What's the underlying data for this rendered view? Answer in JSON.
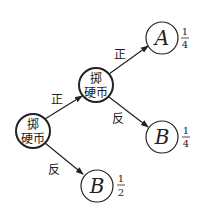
{
  "diagram": {
    "type": "probability-tree",
    "root": {
      "label_line1": "掷",
      "label_line2": "硬币"
    },
    "middle": {
      "label_line1": "掷",
      "label_line2": "硬币"
    },
    "edges": {
      "root_to_middle": "正",
      "root_to_leaf_b2": "反",
      "middle_to_leaf_a": "正",
      "middle_to_leaf_b1": "反"
    },
    "leaves": {
      "a": {
        "label": "A",
        "prob_num": "1",
        "prob_den": "4"
      },
      "b1": {
        "label": "B",
        "prob_num": "1",
        "prob_den": "4"
      },
      "b2": {
        "label": "B",
        "prob_num": "1",
        "prob_den": "2"
      }
    },
    "colors": {
      "stroke": "#222222",
      "background": "#ffffff"
    }
  }
}
